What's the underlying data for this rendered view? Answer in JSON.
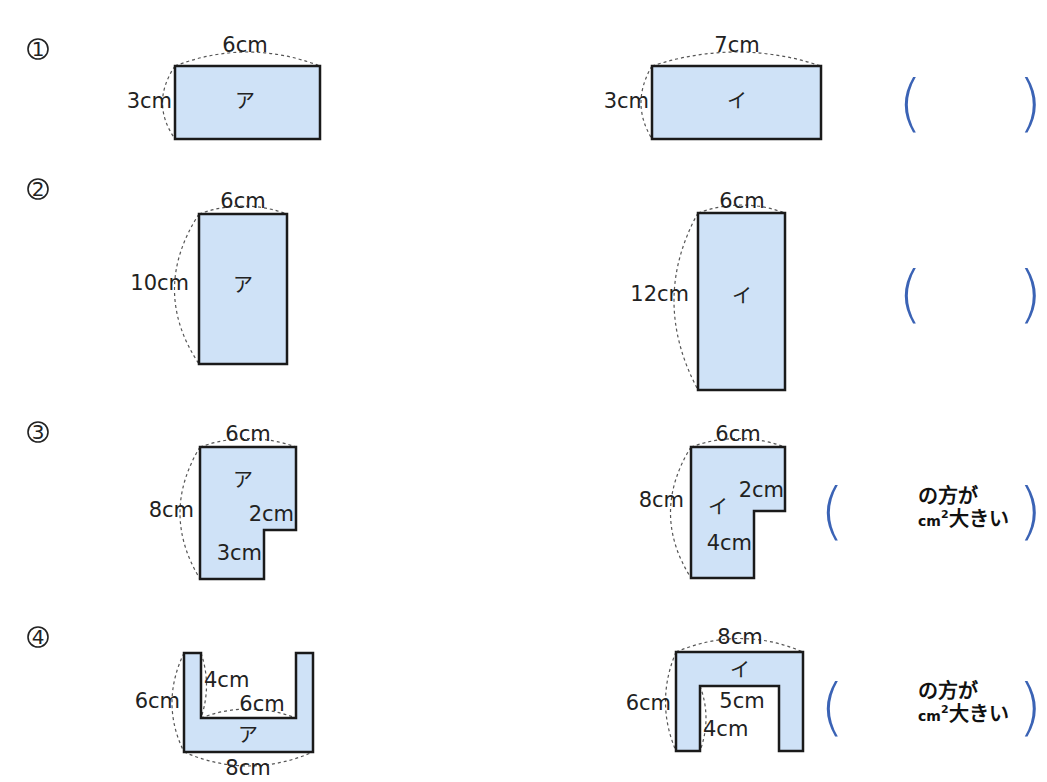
{
  "colors": {
    "shape_fill": "#cfe2f7",
    "bracket": "#3b63b5"
  },
  "problems": [
    {
      "number": "1",
      "left": {
        "name": "ア",
        "labels": {
          "top": "6cm",
          "side": "3cm"
        }
      },
      "right": {
        "name": "イ",
        "labels": {
          "top": "7cm",
          "side": "3cm"
        }
      },
      "answer": {
        "blank": "",
        "text_line1": "",
        "text_line2": ""
      }
    },
    {
      "number": "2",
      "left": {
        "name": "ア",
        "labels": {
          "top": "6cm",
          "side": "10cm"
        }
      },
      "right": {
        "name": "イ",
        "labels": {
          "top": "6cm",
          "side": "12cm"
        }
      },
      "answer": {
        "blank": "",
        "text_line1": "",
        "text_line2": ""
      }
    },
    {
      "number": "3",
      "left": {
        "name": "ア",
        "labels": {
          "top": "6cm",
          "side": "8cm",
          "notch_w": "2cm",
          "notch_h": "3cm"
        }
      },
      "right": {
        "name": "イ",
        "labels": {
          "top": "6cm",
          "side": "8cm",
          "notch_w": "2cm",
          "notch_h": "4cm"
        }
      },
      "answer": {
        "text_line1": "の方が",
        "unit": "cm",
        "unit_sup": "2",
        "text_line2": "大きい"
      }
    },
    {
      "number": "4",
      "left": {
        "name": "ア",
        "labels": {
          "bottom": "8cm",
          "side": "6cm",
          "inner_h": "4cm",
          "inner_w": "6cm"
        }
      },
      "right": {
        "name": "イ",
        "labels": {
          "top": "8cm",
          "side": "6cm",
          "inner_w": "5cm",
          "inner_h": "4cm"
        }
      },
      "answer": {
        "text_line1": "の方が",
        "unit": "cm",
        "unit_sup": "2",
        "text_line2": "大きい"
      }
    }
  ],
  "brackets": {
    "open": "(",
    "close": ")"
  }
}
